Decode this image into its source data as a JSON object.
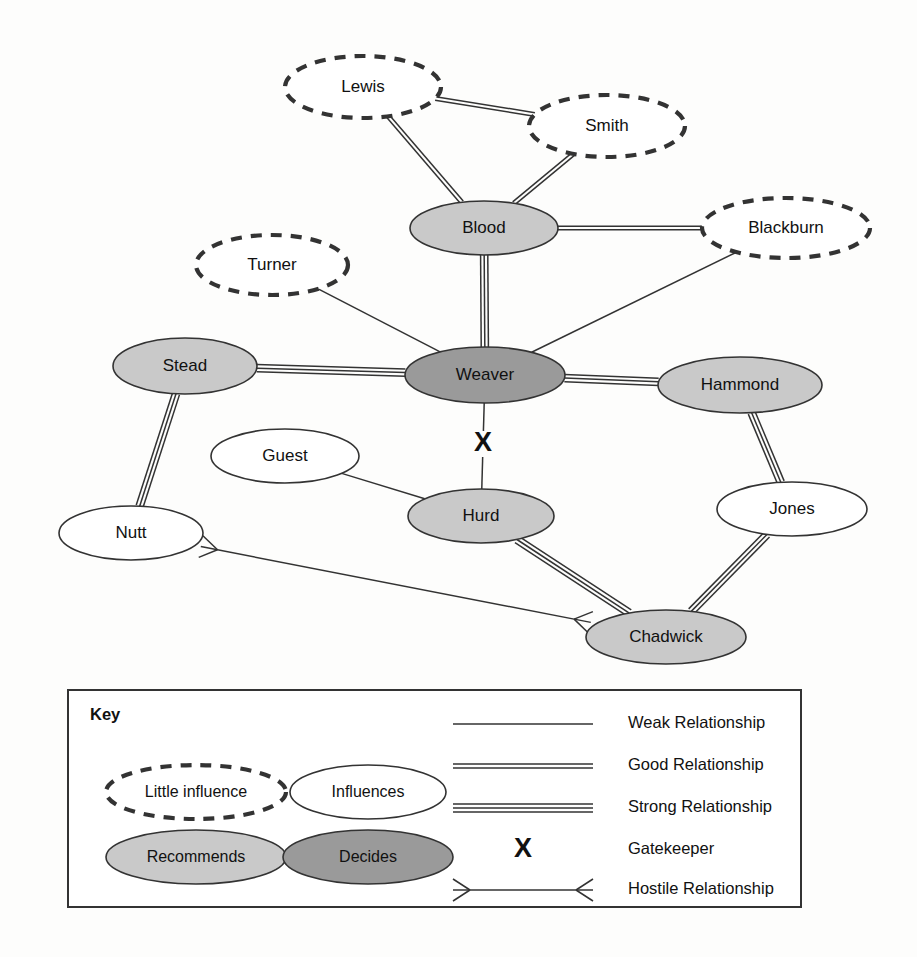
{
  "diagram": {
    "type": "network-influence-map",
    "colors": {
      "background": "#fdfdfc",
      "stroke": "#333333",
      "little_influence_fill": "#ffffff",
      "influences_fill": "#ffffff",
      "recommends_fill": "#c9c9c9",
      "decides_fill": "#9a9a9a",
      "text": "#111111"
    },
    "nodes": [
      {
        "id": "lewis",
        "label": "Lewis",
        "role": "little-influence",
        "cx": 363,
        "cy": 87,
        "rx": 78,
        "ry": 31
      },
      {
        "id": "smith",
        "label": "Smith",
        "role": "little-influence",
        "cx": 607,
        "cy": 126,
        "rx": 78,
        "ry": 31
      },
      {
        "id": "blood",
        "label": "Blood",
        "role": "recommends",
        "cx": 484,
        "cy": 228,
        "rx": 74,
        "ry": 27
      },
      {
        "id": "blackburn",
        "label": "Blackburn",
        "role": "little-influence",
        "cx": 786,
        "cy": 228,
        "rx": 84,
        "ry": 30
      },
      {
        "id": "turner",
        "label": "Turner",
        "role": "little-influence",
        "cx": 272,
        "cy": 265,
        "rx": 76,
        "ry": 30
      },
      {
        "id": "stead",
        "label": "Stead",
        "role": "recommends",
        "cx": 185,
        "cy": 366,
        "rx": 72,
        "ry": 28
      },
      {
        "id": "weaver",
        "label": "Weaver",
        "role": "decides",
        "cx": 485,
        "cy": 375,
        "rx": 80,
        "ry": 28
      },
      {
        "id": "hammond",
        "label": "Hammond",
        "role": "recommends",
        "cx": 740,
        "cy": 385,
        "rx": 82,
        "ry": 28
      },
      {
        "id": "guest",
        "label": "Guest",
        "role": "influences",
        "cx": 285,
        "cy": 456,
        "rx": 74,
        "ry": 27
      },
      {
        "id": "jones",
        "label": "Jones",
        "role": "influences",
        "cx": 792,
        "cy": 509,
        "rx": 75,
        "ry": 27
      },
      {
        "id": "hurd",
        "label": "Hurd",
        "role": "recommends",
        "cx": 481,
        "cy": 516,
        "rx": 73,
        "ry": 27
      },
      {
        "id": "nutt",
        "label": "Nutt",
        "role": "influences",
        "cx": 131,
        "cy": 533,
        "rx": 72,
        "ry": 27
      },
      {
        "id": "chadwick",
        "label": "Chadwick",
        "role": "recommends",
        "cx": 666,
        "cy": 637,
        "rx": 80,
        "ry": 27
      }
    ],
    "edges": [
      {
        "source": "lewis",
        "target": "smith",
        "relationship": "good"
      },
      {
        "source": "lewis",
        "target": "blood",
        "relationship": "good"
      },
      {
        "source": "smith",
        "target": "blood",
        "relationship": "good"
      },
      {
        "source": "blood",
        "target": "blackburn",
        "relationship": "good"
      },
      {
        "source": "blood",
        "target": "weaver",
        "relationship": "strong"
      },
      {
        "source": "weaver",
        "target": "blackburn",
        "relationship": "weak"
      },
      {
        "source": "turner",
        "target": "weaver",
        "relationship": "weak"
      },
      {
        "source": "stead",
        "target": "weaver",
        "relationship": "strong"
      },
      {
        "source": "weaver",
        "target": "hammond",
        "relationship": "strong"
      },
      {
        "source": "stead",
        "target": "nutt",
        "relationship": "strong"
      },
      {
        "source": "weaver",
        "target": "hurd",
        "relationship": "weak",
        "gatekeeper": true
      },
      {
        "source": "guest",
        "target": "hurd",
        "relationship": "weak"
      },
      {
        "source": "hammond",
        "target": "jones",
        "relationship": "strong"
      },
      {
        "source": "jones",
        "target": "chadwick",
        "relationship": "strong"
      },
      {
        "source": "hurd",
        "target": "chadwick",
        "relationship": "strong"
      },
      {
        "source": "nutt",
        "target": "chadwick",
        "relationship": "hostile"
      }
    ]
  },
  "key": {
    "title": "Key",
    "shape_items": [
      {
        "id": "little-influence",
        "label": "Little influence"
      },
      {
        "id": "influences",
        "label": "Influences"
      },
      {
        "id": "recommends",
        "label": "Recommends"
      },
      {
        "id": "decides",
        "label": "Decides"
      }
    ],
    "line_items": [
      {
        "id": "weak",
        "label": "Weak Relationship"
      },
      {
        "id": "good",
        "label": "Good Relationship"
      },
      {
        "id": "strong",
        "label": "Strong Relationship"
      },
      {
        "id": "gatekeeper",
        "label": "Gatekeeper",
        "symbol": "X"
      },
      {
        "id": "hostile",
        "label": "Hostile Relationship"
      }
    ]
  }
}
